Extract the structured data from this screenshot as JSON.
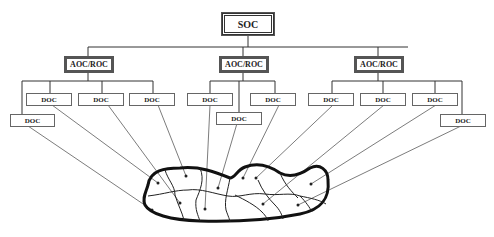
{
  "diagram": {
    "root": {
      "label": "SOC"
    },
    "regions": [
      {
        "label": "AOC/ROC",
        "docs": [
          "DOC",
          "DOC",
          "DOC",
          "DOC"
        ]
      },
      {
        "label": "AOC/ROC",
        "docs": [
          "DOC",
          "DOC",
          "DOC"
        ]
      },
      {
        "label": "AOC/ROC",
        "docs": [
          "DOC",
          "DOC",
          "DOC",
          "DOC"
        ]
      }
    ],
    "colors": {
      "line": "#333333",
      "box_border": "#555555",
      "background": "#ffffff"
    }
  }
}
